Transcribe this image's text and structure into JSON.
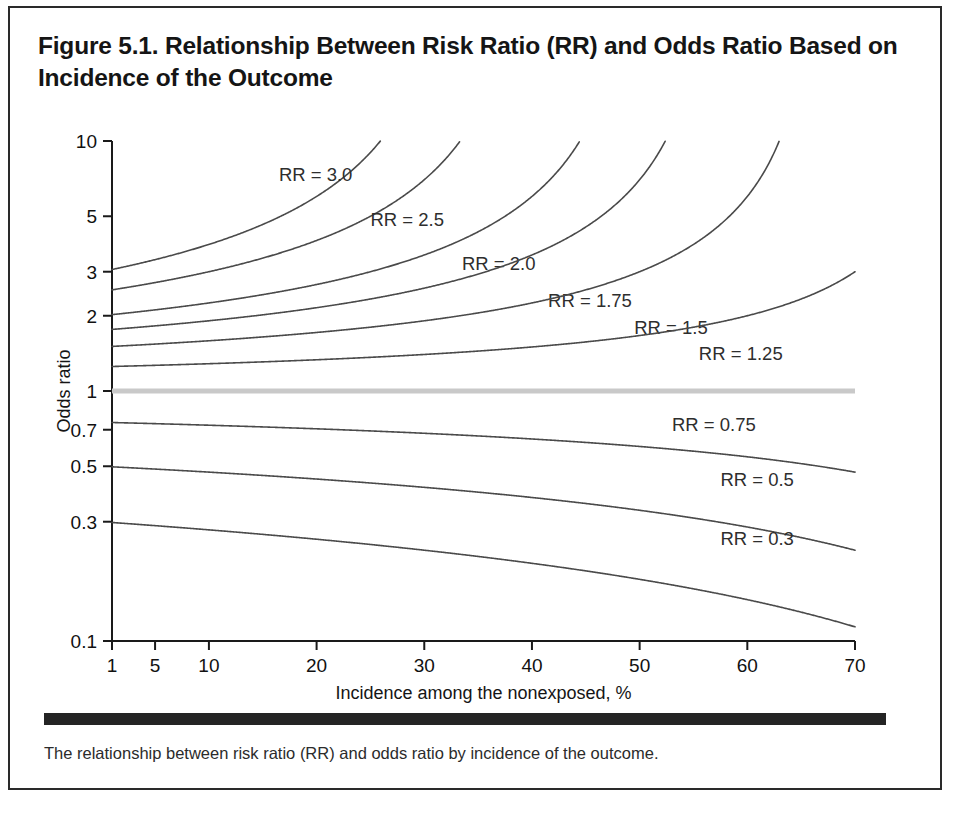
{
  "figure": {
    "title": "Figure 5.1. Relationship Between Risk Ratio (RR) and Odds Ratio Based on Incidence of the Outcome",
    "caption": "The relationship between risk ratio (RR) and odds ratio by incidence of the outcome."
  },
  "chart_data": {
    "type": "line",
    "title": "Figure 5.1. Relationship Between Risk Ratio (RR) and Odds Ratio Based on Incidence of the Outcome",
    "xlabel": "Incidence among the nonexposed, %",
    "ylabel": "Odds ratio",
    "xscale": "linear",
    "yscale": "log",
    "xlim": [
      1,
      70
    ],
    "ylim": [
      0.1,
      10
    ],
    "grid": false,
    "legend_position": "inline-curve-labels",
    "xticks": [
      1,
      5,
      10,
      20,
      30,
      40,
      50,
      60,
      70
    ],
    "xticklabels": [
      "1",
      "5",
      "10",
      "20",
      "30",
      "40",
      "50",
      "60",
      "70"
    ],
    "yticks": [
      10,
      5,
      3,
      2,
      1,
      0.7,
      0.5,
      0.3,
      0.1
    ],
    "yticklabels": [
      "10",
      "5",
      "3",
      "2",
      "1",
      "0.7",
      "0.5",
      "0.3",
      "0.1"
    ],
    "formula": "OR = RR(1 - p) / (1 - RR * p)",
    "x_is_percent": true,
    "reference_line": {
      "value": 1.0,
      "label": "RR = 1.0",
      "color": "#c9c9c9"
    },
    "line_color": "#4a4a4a",
    "series": [
      {
        "name": "RR = 3.0",
        "rr": 3.0,
        "label": "RR = 3.0",
        "label_x": 16.5,
        "label_y": 7.3
      },
      {
        "name": "RR = 2.5",
        "rr": 2.5,
        "label": "RR = 2.5",
        "label_x": 25.0,
        "label_y": 4.85
      },
      {
        "name": "RR = 2.0",
        "rr": 2.0,
        "label": "RR = 2.0",
        "label_x": 33.5,
        "label_y": 3.22
      },
      {
        "name": "RR = 1.75",
        "rr": 1.75,
        "label": "RR = 1.75",
        "label_x": 41.5,
        "label_y": 2.3
      },
      {
        "name": "RR = 1.5",
        "rr": 1.5,
        "label": "RR = 1.5",
        "label_x": 49.5,
        "label_y": 1.78
      },
      {
        "name": "RR = 1.25",
        "rr": 1.25,
        "label": "RR = 1.25",
        "label_x": 55.5,
        "label_y": 1.4
      },
      {
        "name": "RR = 0.75",
        "rr": 0.75,
        "label": "RR = 0.75",
        "label_x": 53.0,
        "label_y": 0.73
      },
      {
        "name": "RR = 0.5",
        "rr": 0.5,
        "label": "RR = 0.5",
        "label_x": 57.5,
        "label_y": 0.44
      },
      {
        "name": "RR = 0.3",
        "rr": 0.3,
        "label": "RR = 0.3",
        "label_x": 57.5,
        "label_y": 0.255
      }
    ]
  }
}
